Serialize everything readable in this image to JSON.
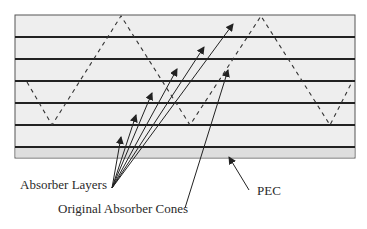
{
  "diagram": {
    "labels": {
      "absorber_layers": "Absorber Layers",
      "original_cones": "Original Absorber Cones",
      "pec": "PEC"
    },
    "colors": {
      "fill": "#eeeeee",
      "pec_fill": "#dedede",
      "line": "#222222",
      "dash": "#333333"
    },
    "box": {
      "x": 15,
      "y": 15,
      "width": 340,
      "height": 143
    },
    "layer_lines_y": [
      37,
      59,
      81,
      103,
      125,
      147
    ],
    "cone_profile": [
      [
        27,
        82
      ],
      [
        52,
        125
      ],
      [
        121,
        16
      ],
      [
        190,
        125
      ],
      [
        261,
        16
      ],
      [
        330,
        125
      ],
      [
        353,
        80
      ]
    ],
    "absorber_arrows": {
      "origin": [
        112,
        188
      ],
      "heads": [
        [
          121,
          137
        ],
        [
          136,
          115
        ],
        [
          152,
          93
        ],
        [
          177,
          69
        ],
        [
          204,
          47
        ],
        [
          233,
          24
        ]
      ]
    },
    "cone_arrow": {
      "from": [
        185,
        208
      ],
      "to": [
        228,
        70
      ]
    },
    "pec_arrow": {
      "from": [
        249,
        190
      ],
      "to": [
        229,
        157
      ]
    }
  }
}
